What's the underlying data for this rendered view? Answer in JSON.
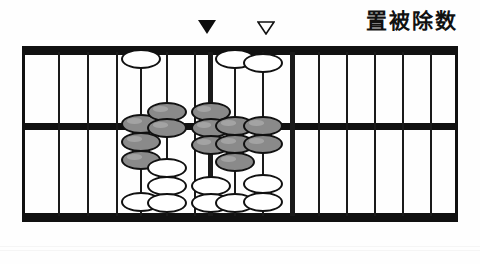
{
  "caption": {
    "text": "置被除数",
    "meaning_label": "place-the-dividend"
  },
  "markers": [
    {
      "name": "solid-down-triangle",
      "style": "solid",
      "x": 198,
      "y": 20,
      "rod_index": 7
    },
    {
      "name": "hollow-down-triangle",
      "style": "hollow",
      "x": 257,
      "y": 21,
      "rod_index": 9
    }
  ],
  "abacus": {
    "type": "suanpan-diagram",
    "frame": {
      "x": 22,
      "y": 46,
      "width": 436,
      "height": 176
    },
    "beam_y": 77,
    "rod_count": 13,
    "colors": {
      "frame": "#111111",
      "rod": "#1a1a1a",
      "bead_inactive": "#ffffff",
      "bead_active": "#8a8a8a",
      "background": "#fefefe",
      "caption": "#111111"
    },
    "rods": [
      {
        "index": 0,
        "x": 36,
        "thick": false,
        "heaven": 0,
        "earth": 0,
        "gray_upper": 0,
        "gray_lower": 0
      },
      {
        "index": 1,
        "x": 65,
        "thick": false,
        "heaven": 0,
        "earth": 0,
        "gray_upper": 0,
        "gray_lower": 0
      },
      {
        "index": 2,
        "x": 94,
        "thick": false,
        "heaven": 0,
        "earth": 0,
        "gray_upper": 0,
        "gray_lower": 0
      },
      {
        "index": 3,
        "x": 118,
        "thick": false,
        "heaven": 1,
        "earth": 1,
        "gray_upper": 0,
        "gray_lower": 3
      },
      {
        "index": 4,
        "x": 144,
        "thick": false,
        "heaven": 0,
        "earth": 3,
        "gray_upper": 1,
        "gray_lower": 1
      },
      {
        "index": 5,
        "x": 172,
        "thick": false,
        "heaven": 0,
        "earth": 0,
        "gray_upper": 0,
        "gray_lower": 0
      },
      {
        "index": 6,
        "x": 186,
        "thick": true,
        "heaven": 0,
        "earth": 2,
        "gray_upper": 1,
        "gray_lower": 2
      },
      {
        "index": 7,
        "x": 212,
        "thick": false,
        "heaven": 1,
        "earth": 1,
        "gray_upper": 0,
        "gray_lower": 3
      },
      {
        "index": 8,
        "x": 240,
        "thick": false,
        "heaven": 1,
        "earth": 2,
        "gray_upper": 0,
        "gray_lower": 2
      },
      {
        "index": 9,
        "x": 268,
        "thick": true,
        "heaven": 0,
        "earth": 0,
        "gray_upper": 0,
        "gray_lower": 0
      },
      {
        "index": 10,
        "x": 296,
        "thick": false,
        "heaven": 0,
        "earth": 0,
        "gray_upper": 0,
        "gray_lower": 0
      },
      {
        "index": 11,
        "x": 324,
        "thick": false,
        "heaven": 0,
        "earth": 0,
        "gray_upper": 0,
        "gray_lower": 0
      },
      {
        "index": 12,
        "x": 352,
        "thick": false,
        "heaven": 0,
        "earth": 0,
        "gray_upper": 0,
        "gray_lower": 0
      },
      {
        "index": 13,
        "x": 380,
        "thick": false,
        "heaven": 0,
        "earth": 0,
        "gray_upper": 0,
        "gray_lower": 0
      },
      {
        "index": 14,
        "x": 408,
        "thick": false,
        "heaven": 0,
        "earth": 0,
        "gray_upper": 0,
        "gray_lower": 0
      }
    ],
    "beads": [
      {
        "rod": 3,
        "color": "white",
        "top": 3,
        "x_offset": 0
      },
      {
        "rod": 3,
        "color": "gray",
        "top": 68,
        "x_offset": 0
      },
      {
        "rod": 3,
        "color": "gray",
        "top": 86,
        "x_offset": 0
      },
      {
        "rod": 3,
        "color": "gray",
        "top": 104,
        "x_offset": 0
      },
      {
        "rod": 3,
        "color": "white",
        "top": 146,
        "x_offset": 0
      },
      {
        "rod": 4,
        "color": "gray",
        "top": 56,
        "x_offset": 0
      },
      {
        "rod": 4,
        "color": "gray",
        "top": 72,
        "x_offset": 0
      },
      {
        "rod": 4,
        "color": "white",
        "top": 112,
        "x_offset": 0
      },
      {
        "rod": 4,
        "color": "white",
        "top": 130,
        "x_offset": 0
      },
      {
        "rod": 4,
        "color": "white",
        "top": 147,
        "x_offset": 0
      },
      {
        "rod": 6,
        "color": "gray",
        "top": 56,
        "x_offset": 0
      },
      {
        "rod": 6,
        "color": "gray",
        "top": 72,
        "x_offset": 0
      },
      {
        "rod": 6,
        "color": "gray",
        "top": 89,
        "x_offset": 0
      },
      {
        "rod": 6,
        "color": "white",
        "top": 130,
        "x_offset": 0
      },
      {
        "rod": 6,
        "color": "white",
        "top": 147,
        "x_offset": 0
      },
      {
        "rod": 7,
        "color": "white",
        "top": 3,
        "x_offset": 0
      },
      {
        "rod": 7,
        "color": "gray",
        "top": 70,
        "x_offset": 0
      },
      {
        "rod": 7,
        "color": "gray",
        "top": 88,
        "x_offset": 0
      },
      {
        "rod": 7,
        "color": "gray",
        "top": 106,
        "x_offset": 0
      },
      {
        "rod": 7,
        "color": "white",
        "top": 147,
        "x_offset": 0
      },
      {
        "rod": 8,
        "color": "white",
        "top": 7,
        "x_offset": 0
      },
      {
        "rod": 8,
        "color": "gray",
        "top": 70,
        "x_offset": 0
      },
      {
        "rod": 8,
        "color": "gray",
        "top": 88,
        "x_offset": 0
      },
      {
        "rod": 8,
        "color": "white",
        "top": 128,
        "x_offset": 0
      },
      {
        "rod": 8,
        "color": "white",
        "top": 146,
        "x_offset": 0
      }
    ]
  }
}
